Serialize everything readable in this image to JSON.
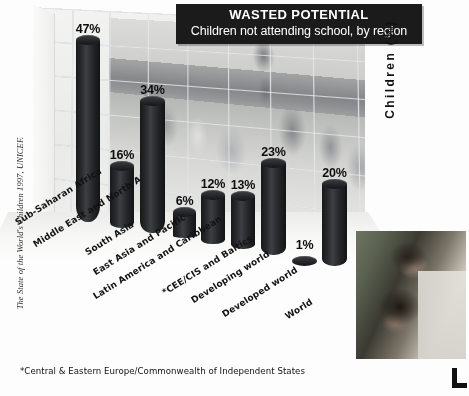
{
  "title": {
    "main": "WASTED POTENTIAL",
    "sub": "Children not attending school, by region"
  },
  "axis": {
    "y_label": "Children (%)"
  },
  "footnote": "*Central & Eastern Europe/Commonwealth of Independent States",
  "source_caption": "The State of the World's Children 1997, UNICEF.",
  "photo_alt_main": "classroom-background-photo",
  "photo_alt_corner": "two-children-photo",
  "colors": {
    "bar": "#1a1c1f",
    "title_plate_bg": "#1b1b1b",
    "title_text": "#ffffff",
    "label_text": "#111111",
    "grid_line": "#969ba5",
    "background": "#fdfdfd"
  },
  "chart_data": {
    "type": "bar",
    "title": "WASTED POTENTIAL",
    "subtitle": "Children not attending school, by region",
    "xlabel": "",
    "ylabel": "Children (%)",
    "ylim": [
      0,
      50
    ],
    "grid": true,
    "legend": "none",
    "categories": [
      "Sub-Saharan Africa",
      "Middle East and North Africa",
      "South Asia",
      "East Asia and Pacific",
      "Latin America and Caribbean",
      "*CEE/CIS and Baltics",
      "Developing world",
      "Developed world",
      "World"
    ],
    "values": [
      47,
      16,
      34,
      6,
      12,
      13,
      23,
      1,
      20
    ],
    "value_labels": [
      "47%",
      "16%",
      "34%",
      "6%",
      "12%",
      "13%",
      "23%",
      "1%",
      "20%"
    ],
    "footnote": "*Central & Eastern Europe/Commonwealth of Independent States",
    "source": "The State of the World's Children 1997, UNICEF."
  },
  "bars": [
    {
      "label": "Sub-Saharan Africa",
      "value_label": "47%",
      "left": 76,
      "width": 24,
      "base": 222,
      "height": 182,
      "cat_x": 16,
      "cat_y": 218
    },
    {
      "label": "Middle East and North Africa",
      "value_label": "16%",
      "left": 110,
      "width": 24,
      "base": 228,
      "height": 62,
      "cat_x": 34,
      "cat_y": 240
    },
    {
      "label": "South Asia",
      "value_label": "34%",
      "left": 140,
      "width": 25,
      "base": 233,
      "height": 132,
      "cat_x": 86,
      "cat_y": 248
    },
    {
      "label": "East Asia and Pacific",
      "value_label": "6%",
      "left": 173,
      "width": 23,
      "base": 238,
      "height": 26,
      "cat_x": 94,
      "cat_y": 268
    },
    {
      "label": "Latin America and Caribbean",
      "value_label": "12%",
      "left": 201,
      "width": 24,
      "base": 244,
      "height": 49,
      "cat_x": 94,
      "cat_y": 292
    },
    {
      "label": "*CEE/CIS and Baltics",
      "value_label": "13%",
      "left": 231,
      "width": 24,
      "base": 249,
      "height": 53,
      "cat_x": 163,
      "cat_y": 288
    },
    {
      "label": "Developing world",
      "value_label": "23%",
      "left": 261,
      "width": 25,
      "base": 255,
      "height": 92,
      "cat_x": 192,
      "cat_y": 296
    },
    {
      "label": "Developed world",
      "value_label": "1%",
      "left": 292,
      "width": 25,
      "base": 261,
      "height": 5,
      "cat_x": 223,
      "cat_y": 310
    },
    {
      "label": "World",
      "value_label": "20%",
      "left": 322,
      "width": 25,
      "base": 266,
      "height": 82,
      "cat_x": 286,
      "cat_y": 312
    }
  ]
}
